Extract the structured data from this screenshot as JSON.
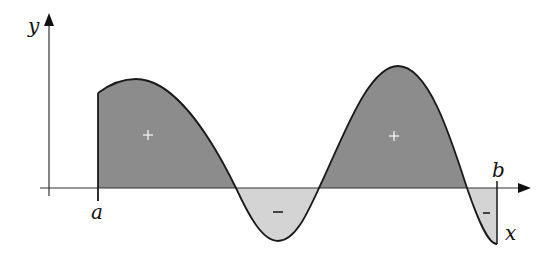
{
  "diagram": {
    "title": "",
    "axes": {
      "x_label": "x",
      "y_label": "y"
    },
    "bounds": {
      "lower_label": "a",
      "upper_label": "b"
    },
    "regions": [
      {
        "sign": "+",
        "shade": "dark",
        "description": "area above x-axis between a and first zero"
      },
      {
        "sign": "−",
        "shade": "light",
        "description": "area below x-axis (trough)"
      },
      {
        "sign": "+",
        "shade": "dark",
        "description": "area above x-axis (second hump)"
      },
      {
        "sign": "−",
        "shade": "light",
        "description": "area below x-axis near b"
      }
    ],
    "colors": {
      "positive_fill": "#8c8c8c",
      "negative_fill": "#d4d4d4",
      "curve": "#1a1a1a",
      "axis": "#333333"
    }
  }
}
